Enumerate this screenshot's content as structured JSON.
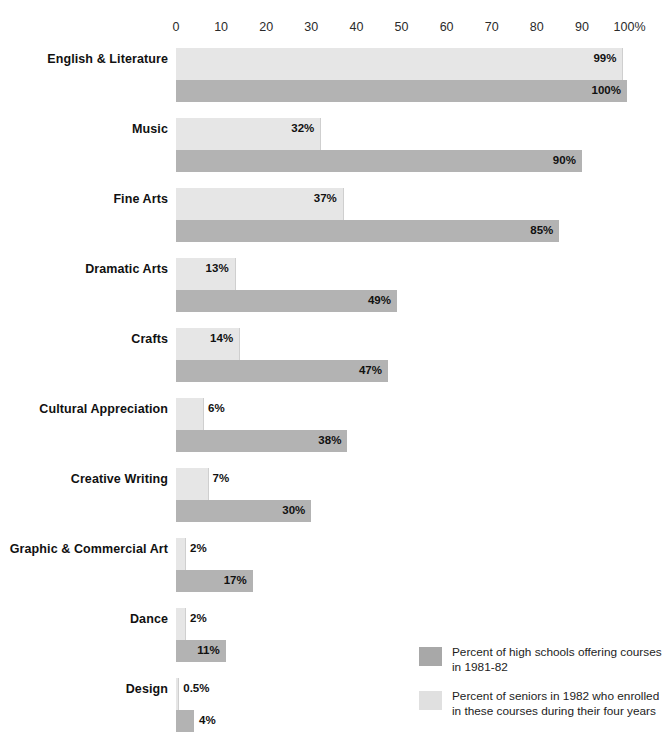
{
  "top_crop_remnant": "·  ·          ·        ·     ·       ·",
  "chart_data": {
    "type": "bar",
    "orientation": "horizontal",
    "title": "",
    "subtitle": "",
    "xlabel": "",
    "ylabel": "",
    "xlim": [
      0,
      100
    ],
    "grid": false,
    "axis_ticks": [
      "0",
      "10",
      "20",
      "30",
      "40",
      "50",
      "60",
      "70",
      "80",
      "90",
      "100%"
    ],
    "axis_tick_values": [
      0,
      10,
      20,
      30,
      40,
      50,
      60,
      70,
      80,
      90,
      100
    ],
    "legend_position": "bottom-right",
    "categories": [
      "English & Literature",
      "Music",
      "Fine Arts",
      "Dramatic Arts",
      "Crafts",
      "Cultural Appreciation",
      "Creative Writing",
      "Graphic & Commercial Art",
      "Dance",
      "Design"
    ],
    "series": [
      {
        "name": "Percent of seniors in 1982 who enrolled in these courses during their four years",
        "key": "seniors_enrolled",
        "color": "#e6e6e6",
        "values": [
          99,
          32,
          37,
          13,
          14,
          6,
          7,
          2,
          2,
          0.5
        ],
        "labels": [
          "99%",
          "32%",
          "37%",
          "13%",
          "14%",
          "6%",
          "7%",
          "2%",
          "2%",
          "0.5%"
        ]
      },
      {
        "name": "Percent of high schools offering courses in 1981-82",
        "key": "schools_offering",
        "color": "#b3b3b3",
        "values": [
          100,
          90,
          85,
          49,
          47,
          38,
          30,
          17,
          11,
          4
        ],
        "labels": [
          "100%",
          "90%",
          "85%",
          "49%",
          "47%",
          "38%",
          "30%",
          "17%",
          "11%",
          "4%"
        ]
      }
    ],
    "rows": [
      {
        "category": "English & Literature",
        "seniors_enrolled": 99,
        "seniors_label": "99%",
        "schools_offering": 100,
        "schools_label": "100%"
      },
      {
        "category": "Music",
        "seniors_enrolled": 32,
        "seniors_label": "32%",
        "schools_offering": 90,
        "schools_label": "90%"
      },
      {
        "category": "Fine Arts",
        "seniors_enrolled": 37,
        "seniors_label": "37%",
        "schools_offering": 85,
        "schools_label": "85%"
      },
      {
        "category": "Dramatic Arts",
        "seniors_enrolled": 13,
        "seniors_label": "13%",
        "schools_offering": 49,
        "schools_label": "49%"
      },
      {
        "category": "Crafts",
        "seniors_enrolled": 14,
        "seniors_label": "14%",
        "schools_offering": 47,
        "schools_label": "47%"
      },
      {
        "category": "Cultural Appreciation",
        "seniors_enrolled": 6,
        "seniors_label": "6%",
        "schools_offering": 38,
        "schools_label": "38%"
      },
      {
        "category": "Creative Writing",
        "seniors_enrolled": 7,
        "seniors_label": "7%",
        "schools_offering": 30,
        "schools_label": "30%"
      },
      {
        "category": "Graphic & Commercial Art",
        "seniors_enrolled": 2,
        "seniors_label": "2%",
        "schools_offering": 17,
        "schools_label": "17%"
      },
      {
        "category": "Dance",
        "seniors_enrolled": 2,
        "seniors_label": "2%",
        "schools_offering": 11,
        "schools_label": "11%"
      },
      {
        "category": "Design",
        "seniors_enrolled": 0.5,
        "seniors_label": "0.5%",
        "schools_offering": 4,
        "schools_label": "4%"
      }
    ]
  },
  "legend": {
    "items": [
      {
        "color": "#a8a8a8",
        "line1": "Percent of high schools offering courses",
        "line2": "in 1981-82"
      },
      {
        "color": "#e0e0e0",
        "line1": "Percent of seniors in 1982 who enrolled",
        "line2": "in these courses during their four years"
      }
    ]
  }
}
